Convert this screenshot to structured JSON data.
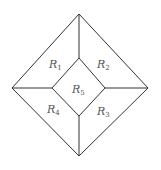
{
  "diagram": {
    "type": "nested-diamond-regions",
    "outer": {
      "top": [
        79,
        14
      ],
      "right": [
        148,
        88
      ],
      "bottom": [
        79,
        156
      ],
      "left": [
        12,
        88
      ]
    },
    "inner": {
      "top": [
        79,
        58
      ],
      "right": [
        105,
        88
      ],
      "bottom": [
        79,
        116
      ],
      "left": [
        52,
        88
      ]
    },
    "stroke_color": "#333333",
    "regions": [
      {
        "id": "R1",
        "base": "R",
        "sub": "1",
        "x": 52,
        "y": 68
      },
      {
        "id": "R2",
        "base": "R",
        "sub": "2",
        "x": 99,
        "y": 68
      },
      {
        "id": "R3",
        "base": "R",
        "sub": "3",
        "x": 99,
        "y": 115
      },
      {
        "id": "R4",
        "base": "R",
        "sub": "4",
        "x": 49,
        "y": 113
      },
      {
        "id": "R5",
        "base": "R",
        "sub": "5",
        "x": 74,
        "y": 94
      }
    ]
  }
}
